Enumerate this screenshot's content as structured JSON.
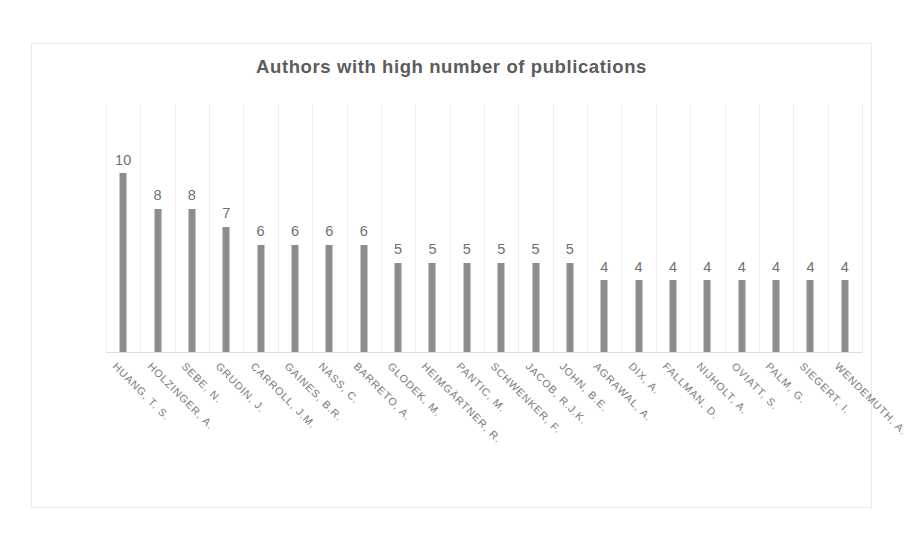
{
  "chart_data": {
    "type": "bar",
    "title": "Authors with high number of publications",
    "xlabel": "",
    "ylabel": "",
    "ylim": [
      0,
      10
    ],
    "grid": "vertical",
    "legend": "none",
    "orientation": "vertical",
    "value_labels": true,
    "categories": [
      "HUANG, T. S.",
      "HOLZINGER, A.",
      "SEBE, N.",
      "GRUDIN, J.",
      "CARROLL, J.M.",
      "GAINES, B.R.",
      "NASS, C.",
      "BARRETO, A.",
      "GLODEK, M.",
      "HEIMGÄRTNER, R.",
      "PANTIC, M.",
      "SCHWENKER, F.",
      "JACOB, R.J.K.",
      "JOHN, B.E.",
      "AGRAWAL, A.",
      "DIX, A.",
      "FALLMAN, D.",
      "NIJHOLT, A.",
      "OVIATT, S.",
      "PALM, G.",
      "SIEGERT, I.",
      "WENDEMUTH, A."
    ],
    "values": [
      10,
      8,
      8,
      7,
      6,
      6,
      6,
      6,
      5,
      5,
      5,
      5,
      5,
      5,
      4,
      4,
      4,
      4,
      4,
      4,
      4,
      4
    ]
  },
  "style": {
    "bar_color": "#8d8d8d",
    "title_color": "#5c5c5c",
    "label_color": "#7a7a7a",
    "value_color": "#6f6f6f",
    "grid_color": "#f1f0ef",
    "border_color": "#eceaea",
    "background": "#ffffff"
  }
}
